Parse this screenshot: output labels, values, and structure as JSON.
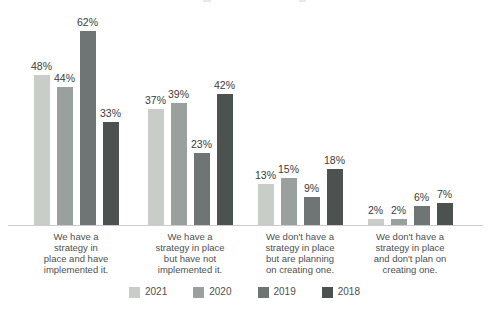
{
  "chart_data": {
    "type": "bar",
    "title": "",
    "xlabel": "",
    "ylabel": "",
    "value_suffix": "%",
    "ylim": [
      0,
      65
    ],
    "grid": false,
    "legend_position": "bottom",
    "axis_line_color": "#cbcbcb",
    "categories": [
      "We have a\nstrategy in\nplace and have\nimplemented it.",
      "We have a\nstrategy in place\nbut have not\nimplemented it.",
      "We don't have a\nstrategy in place\nbut are planning\non creating one.",
      "We don't have a\nstrategy in place\nand don't plan on\ncreating one."
    ],
    "series": [
      {
        "name": "2021",
        "color": "#c9cdc8",
        "values": [
          48,
          37,
          13,
          2
        ]
      },
      {
        "name": "2020",
        "color": "#9aa09d",
        "values": [
          44,
          39,
          15,
          2
        ]
      },
      {
        "name": "2019",
        "color": "#6f7574",
        "values": [
          62,
          23,
          9,
          6
        ]
      },
      {
        "name": "2018",
        "color": "#4c5250",
        "values": [
          33,
          42,
          18,
          7
        ]
      }
    ]
  }
}
